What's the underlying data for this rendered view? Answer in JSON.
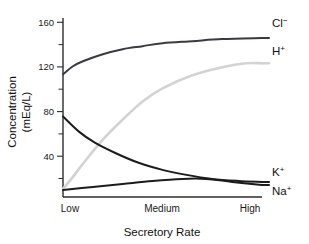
{
  "figure": {
    "background": "#ffffff",
    "plot_area": {
      "left": 63,
      "right": 262,
      "top": 18,
      "bottom": 197
    }
  },
  "axes": {
    "y_title_line1": "Concentration",
    "y_title_line2": "(mEq/L)",
    "x_title": "Secretory Rate",
    "y_ticks_major": [
      "40",
      "80",
      "120",
      "160"
    ],
    "y_ticks_minor": [
      "20",
      "60",
      "100",
      "140"
    ],
    "x_ticks": [
      "Low",
      "Medium",
      "High"
    ]
  },
  "series_labels": {
    "cl": "Cl",
    "cl_charge": "−",
    "h": "H",
    "h_charge": "+",
    "k": "K",
    "k_charge": "+",
    "na": "Na",
    "na_charge": "+"
  },
  "chart_data": {
    "type": "line",
    "title": "",
    "subtitle": "",
    "xlabel": "Secretory Rate",
    "ylabel": "Concentration (mEq/L)",
    "x": [
      "Low",
      "Medium",
      "High"
    ],
    "x_numeric": [
      0,
      0.5,
      1
    ],
    "xlim": [
      0,
      1
    ],
    "ylim": [
      0,
      178
    ],
    "ytick_values": [
      40,
      80,
      120,
      160
    ],
    "yminor_tick_values": [
      20,
      60,
      100,
      140
    ],
    "grid": false,
    "legend_position": "right-inline-end-of-curve",
    "series": [
      {
        "name": "Cl−",
        "color": "#3a3a42",
        "width": 2.0,
        "points": [
          {
            "x": 0.0,
            "y": 122
          },
          {
            "x": 0.05,
            "y": 130
          },
          {
            "x": 0.1,
            "y": 135
          },
          {
            "x": 0.2,
            "y": 142
          },
          {
            "x": 0.3,
            "y": 147
          },
          {
            "x": 0.4,
            "y": 150
          },
          {
            "x": 0.5,
            "y": 153
          },
          {
            "x": 0.65,
            "y": 155
          },
          {
            "x": 0.8,
            "y": 157
          },
          {
            "x": 1.0,
            "y": 158
          }
        ]
      },
      {
        "name": "H+",
        "color": "#d3d3d3",
        "width": 2.6,
        "points": [
          {
            "x": 0.0,
            "y": 8
          },
          {
            "x": 0.05,
            "y": 20
          },
          {
            "x": 0.1,
            "y": 33
          },
          {
            "x": 0.2,
            "y": 57
          },
          {
            "x": 0.3,
            "y": 77
          },
          {
            "x": 0.4,
            "y": 95
          },
          {
            "x": 0.5,
            "y": 108
          },
          {
            "x": 0.65,
            "y": 121
          },
          {
            "x": 0.8,
            "y": 129
          },
          {
            "x": 0.92,
            "y": 133
          },
          {
            "x": 1.0,
            "y": 133
          }
        ]
      },
      {
        "name": "K+",
        "color": "#1c1c1c",
        "width": 2.0,
        "points": [
          {
            "x": 0.0,
            "y": 80
          },
          {
            "x": 0.08,
            "y": 65
          },
          {
            "x": 0.16,
            "y": 54
          },
          {
            "x": 0.26,
            "y": 44
          },
          {
            "x": 0.38,
            "y": 34
          },
          {
            "x": 0.5,
            "y": 27
          },
          {
            "x": 0.62,
            "y": 22
          },
          {
            "x": 0.75,
            "y": 18
          },
          {
            "x": 0.88,
            "y": 16
          },
          {
            "x": 1.0,
            "y": 15
          }
        ]
      },
      {
        "name": "Na+",
        "color": "#1c1c1c",
        "width": 2.0,
        "points": [
          {
            "x": 0.0,
            "y": 7
          },
          {
            "x": 0.15,
            "y": 10
          },
          {
            "x": 0.3,
            "y": 13
          },
          {
            "x": 0.45,
            "y": 16
          },
          {
            "x": 0.6,
            "y": 18
          },
          {
            "x": 0.72,
            "y": 18
          },
          {
            "x": 0.85,
            "y": 15
          },
          {
            "x": 1.0,
            "y": 12
          }
        ]
      }
    ],
    "annotations": [
      {
        "text": "Cl−",
        "series": "Cl−",
        "position": "right"
      },
      {
        "text": "H+",
        "series": "H+",
        "position": "right"
      },
      {
        "text": "K+",
        "series": "K+",
        "position": "right"
      },
      {
        "text": "Na+",
        "series": "Na+",
        "position": "right"
      }
    ]
  }
}
